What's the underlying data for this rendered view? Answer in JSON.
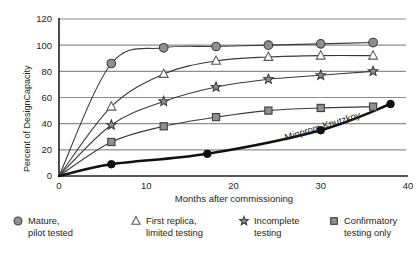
{
  "chart_data": {
    "type": "line",
    "title": "",
    "xlabel": "Months after commissioning",
    "ylabel": "Percent of DesignCapacity",
    "xlim": [
      0,
      40
    ],
    "ylim": [
      0,
      120
    ],
    "xticks": [
      0,
      10,
      20,
      30,
      40
    ],
    "yticks": [
      0,
      20,
      40,
      60,
      80,
      100,
      120
    ],
    "grid": "horizontal",
    "legend_position": "below-plot",
    "series": [
      {
        "name": "Mature, pilot tested",
        "marker": "circle-filled",
        "color": "#8f8f8f",
        "x": [
          0,
          6,
          12,
          18,
          24,
          30,
          36
        ],
        "y": [
          0,
          86,
          98,
          99,
          100,
          101,
          102
        ]
      },
      {
        "name": "First replica, limited testing",
        "marker": "triangle-hollow",
        "color": "#ffffff",
        "x": [
          0,
          6,
          12,
          18,
          24,
          30,
          36
        ],
        "y": [
          0,
          53,
          78,
          88,
          91,
          92,
          92
        ]
      },
      {
        "name": "Incomplete testing",
        "marker": "star-filled",
        "color": "#8f8f8f",
        "x": [
          0,
          6,
          12,
          18,
          24,
          30,
          36
        ],
        "y": [
          0,
          39,
          57,
          68,
          74,
          77,
          80
        ]
      },
      {
        "name": "Confirmatory testing only",
        "marker": "square-filled",
        "color": "#8f8f8f",
        "x": [
          0,
          6,
          12,
          18,
          24,
          30,
          36
        ],
        "y": [
          0,
          26,
          38,
          45,
          50,
          52,
          53
        ]
      },
      {
        "name": "Minprom Knutzkoy",
        "marker": "circle-black",
        "color": "#111111",
        "x": [
          0,
          6,
          17,
          30,
          38
        ],
        "y": [
          0,
          9,
          17,
          35,
          55
        ]
      }
    ],
    "annotations": [
      {
        "text": "Minprom Knutzkoy",
        "x": 26,
        "y": 27,
        "rotation": -17
      }
    ]
  },
  "axes": {
    "y_title": "Percent of DesignCapacity",
    "x_title": "Months after commissioning",
    "y_tick_labels": [
      "0",
      "20",
      "40",
      "60",
      "80",
      "100",
      "120"
    ],
    "x_tick_labels": [
      "0",
      "10",
      "20",
      "30",
      "40"
    ]
  },
  "legend": {
    "items": [
      {
        "marker": "circle-filled",
        "line1": "Mature,",
        "line2": "pilot tested"
      },
      {
        "marker": "triangle-hollow",
        "line1": "First replica,",
        "line2": "limited testing"
      },
      {
        "marker": "star-filled",
        "line1": "Incomplete",
        "line2": "testing"
      },
      {
        "marker": "square-filled",
        "line1": "Confirmatory",
        "line2": "testing only"
      }
    ]
  },
  "colors": {
    "marker_gray": "#8f8f8f",
    "grid_gray": "#8e8e8e",
    "axis_black": "#231f20",
    "highlight_black": "#111111"
  }
}
